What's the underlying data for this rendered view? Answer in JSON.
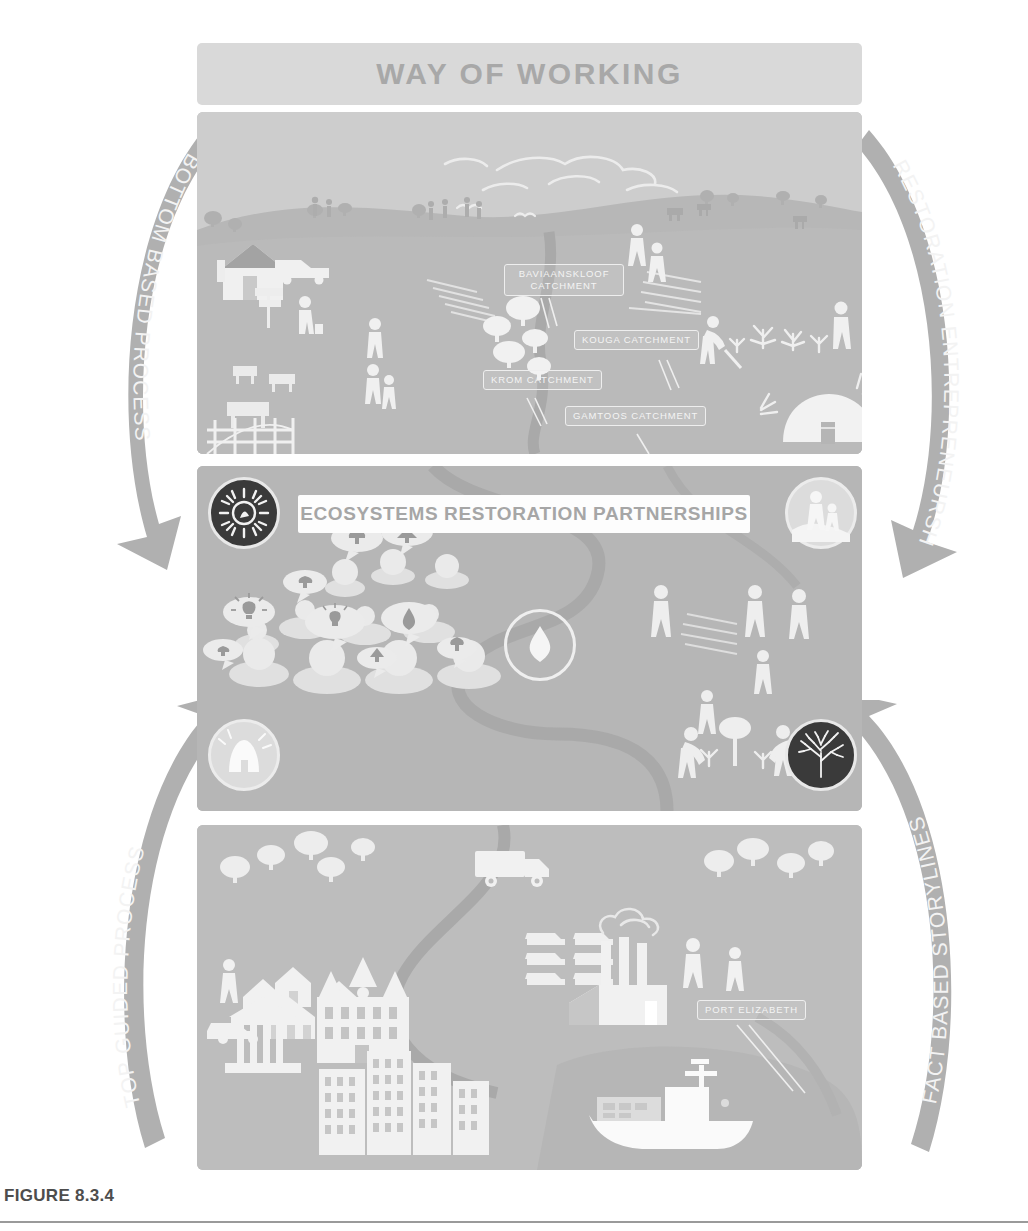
{
  "figure": {
    "caption": "FIGURE 8.3.4",
    "banner_title": "WAY OF WORKING"
  },
  "colors": {
    "page_background": "#ffffff",
    "banner_background": "#d9d9d9",
    "banner_text": "#a8a8a8",
    "panel_top": "#bfbfbf",
    "panel_middle": "#b6b6b6",
    "panel_bottom": "#bdbdbd",
    "sky": "#cfcfcf",
    "arrow": "#b0b0b0",
    "arrow_text": "#f3f3f3",
    "silhouette": "#f2f2f2",
    "badge_dark": "#3a3a3a",
    "badge_light": "#dcdcdc",
    "mid_title_background": "#fdfdfd",
    "mid_title_text": "#a6a6a6",
    "river": "#ababab",
    "caption_text": "#4d4d4d"
  },
  "arrows": [
    {
      "id": "bottom-based-process",
      "label": "BOTTOM BASED PROCESS",
      "position": "top-left",
      "direction": "down"
    },
    {
      "id": "restoration-entrepreneurship",
      "label": "RESTORATION ENTREPRENEURSHIP",
      "position": "top-right",
      "direction": "down"
    },
    {
      "id": "top-guided-process",
      "label": "TOP GUIDED PROCESS",
      "position": "bottom-left",
      "direction": "up"
    },
    {
      "id": "fact-based-storylines",
      "label": "FACT BASED STORYLINES",
      "position": "bottom-right",
      "direction": "up"
    }
  ],
  "panels": {
    "top": {
      "name": "catchment-landscape",
      "callouts": [
        {
          "id": "baviaanskloof",
          "label": "BAVIAANSKLOOF CATCHMENT"
        },
        {
          "id": "kouga",
          "label": "KOUGA CATCHMENT"
        },
        {
          "id": "krom",
          "label": "KROM CATCHMENT"
        },
        {
          "id": "gamtoos",
          "label": "GAMTOOS CATCHMENT"
        }
      ],
      "scene_elements": [
        "clouds",
        "birds",
        "hills",
        "trees",
        "farmhouse",
        "pickup-truck",
        "signpost",
        "fence",
        "cattle",
        "crop-rows",
        "farmers",
        "goats",
        "restoration-workers",
        "spekboom-plants",
        "beehive-hut",
        "river"
      ]
    },
    "middle": {
      "name": "ecosystems-restoration-partnerships",
      "title": "ECOSYSTEMS RESTORATION PARTNERSHIPS",
      "badges": [
        {
          "id": "sun-spark-badge",
          "icon": "sun-burst-icon",
          "style": "dark",
          "corner": "top-left"
        },
        {
          "id": "people-badge",
          "icon": "adult-child-icon",
          "style": "light",
          "corner": "top-right"
        },
        {
          "id": "hut-badge",
          "icon": "hut-icon",
          "style": "light",
          "corner": "bottom-left"
        },
        {
          "id": "tree-badge",
          "icon": "tree-icon",
          "style": "dark",
          "corner": "bottom-right"
        },
        {
          "id": "water-drop-badge",
          "icon": "water-drop-icon",
          "style": "outline",
          "corner": "center"
        }
      ],
      "scene_elements": [
        "crowd-with-speech-bubbles",
        "lightbulb-bubble",
        "tree-bubble",
        "water-drop-bubble",
        "meandering-river",
        "crop-rows",
        "standing-people",
        "tree-planters"
      ]
    },
    "bottom": {
      "name": "urban-port-landscape",
      "callouts": [
        {
          "id": "port-elizabeth",
          "label": "PORT ELIZABETH"
        }
      ],
      "scene_elements": [
        "trees",
        "village-houses",
        "car",
        "pedestrians",
        "delivery-truck",
        "parked-cars",
        "factory-with-smokestacks",
        "classical-building",
        "cathedral",
        "city-blocks",
        "cargo-ship",
        "river",
        "bay"
      ]
    }
  }
}
